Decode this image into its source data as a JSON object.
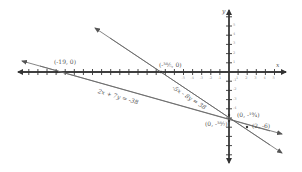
{
  "chart_data": {
    "type": "line",
    "title": "",
    "xlabel": "x",
    "ylabel": "y",
    "xlim": [
      -23,
      6
    ],
    "ylim": [
      -10,
      7
    ],
    "grid": false,
    "x_ticks_labeled": [
      -5,
      -4,
      -3,
      -2,
      -1,
      1,
      2,
      3,
      4,
      5
    ],
    "y_ticks_labeled": [
      5,
      4,
      3,
      2,
      1,
      -1,
      -2,
      -3,
      -4
    ],
    "series": [
      {
        "name": "-5x - 8y = 38",
        "equation": "-5x - 8y = 38",
        "x": [
          -15.2,
          6
        ],
        "y": [
          4.75,
          -8.5
        ]
      },
      {
        "name": "2x + 7y = -38",
        "equation": "2x + 7y = -38",
        "x": [
          -22.5,
          6
        ],
        "y": [
          1.0,
          -7.1
        ]
      }
    ],
    "annotations": [
      {
        "label": "(-19, 0)",
        "x": -19,
        "y": 0
      },
      {
        "label": "(-38/5, 0)",
        "x": -7.6,
        "y": 0
      },
      {
        "label": "(0, -19/4)",
        "x": 0,
        "y": -4.75
      },
      {
        "label": "(0, -38/7)",
        "x": 0,
        "y": -5.43
      },
      {
        "label": "(2, -6)",
        "x": 2,
        "y": -6
      }
    ]
  },
  "labels": {
    "x_axis": "x",
    "y_axis": "y",
    "pt_neg19": "(-19, 0)",
    "pt_xint2": "(-³⁸⁄₅, 0)",
    "pt_yint1": "(0, -¹⁹⁄₄)",
    "pt_yint2": "(0, -³⁸⁄₇)",
    "pt_intersect": "(2, -6)",
    "eq1": "-5x - 8y = 38",
    "eq2": "2x + 7y = -38"
  },
  "ticks": {
    "x": [
      "-5",
      "-4",
      "-3",
      "-2",
      "-1",
      "1",
      "2",
      "3",
      "4",
      "5"
    ],
    "y": [
      "5",
      "4",
      "3",
      "2",
      "1",
      "-1",
      "-2",
      "-3",
      "-4"
    ]
  },
  "colors": {
    "axis": "#333333",
    "line": "#666666",
    "text": "#555555"
  }
}
